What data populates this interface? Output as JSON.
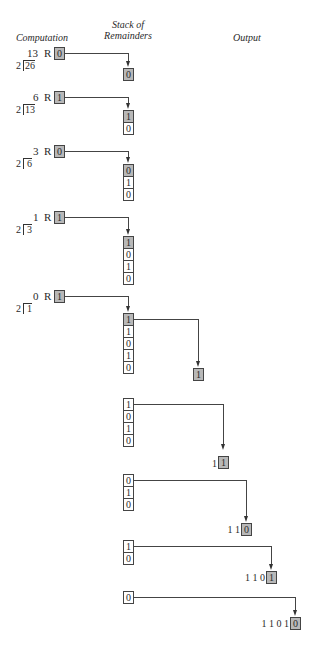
{
  "headers": {
    "computation": "Computation",
    "stack_line1": "Stack of",
    "stack_line2": "Remainders",
    "output": "Output"
  },
  "steps": [
    {
      "quotient": "13",
      "r_label": "R",
      "remainder": "0",
      "divisor": "2",
      "dividend": "26"
    },
    {
      "quotient": "6",
      "r_label": "R",
      "remainder": "1",
      "divisor": "2",
      "dividend": "13"
    },
    {
      "quotient": "3",
      "r_label": "R",
      "remainder": "0",
      "divisor": "2",
      "dividend": "6"
    },
    {
      "quotient": "1",
      "r_label": "R",
      "remainder": "1",
      "divisor": "2",
      "dividend": "3"
    },
    {
      "quotient": "0",
      "r_label": "R",
      "remainder": "1",
      "divisor": "2",
      "dividend": "1"
    }
  ],
  "stacks_push": [
    [
      "0"
    ],
    [
      "1",
      "0"
    ],
    [
      "0",
      "1",
      "0"
    ],
    [
      "1",
      "0",
      "1",
      "0"
    ],
    [
      "1",
      "1",
      "0",
      "1",
      "0"
    ]
  ],
  "stacks_pop": [
    [
      "1",
      "0",
      "1",
      "0"
    ],
    [
      "0",
      "1",
      "0"
    ],
    [
      "1",
      "0"
    ],
    [
      "0"
    ]
  ],
  "outputs": [
    {
      "prefix": "",
      "popped": "1"
    },
    {
      "prefix": "1",
      "popped": "1"
    },
    {
      "prefix": "1 1",
      "popped": "0"
    },
    {
      "prefix": "1 1 0",
      "popped": "1"
    },
    {
      "prefix": "1 1 0 1",
      "popped": "0"
    }
  ],
  "colors": {
    "highlight": "#b8b8b8",
    "line": "#444444"
  }
}
